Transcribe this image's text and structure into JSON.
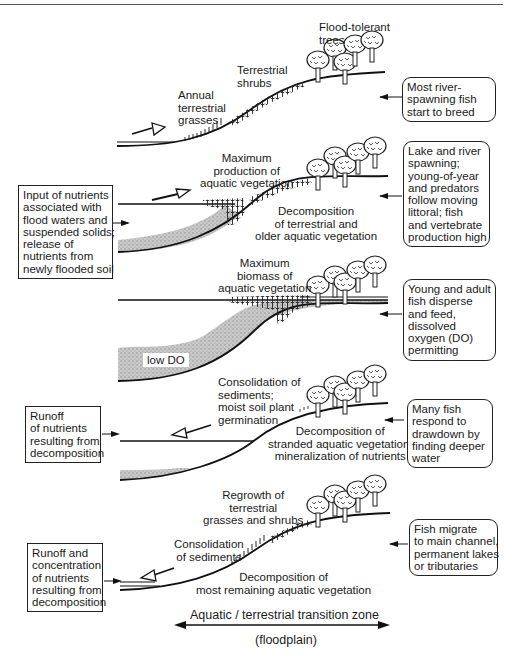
{
  "diagram": {
    "title_axis": {
      "label": "Aquatic / terrestrial transition zone",
      "sublabel": "(floodplain)"
    },
    "panels": [
      {
        "stage": 1,
        "vegetation_labels": [
          "Flood-tolerant\ntrees",
          "Terrestrial\nshrubs",
          "Annual\nterrestrial\ngrasses"
        ],
        "process_labels": [],
        "left_box": null,
        "right_box": "Most river-\nspawning fish\nstart to breed",
        "water_arrow": "rising"
      },
      {
        "stage": 2,
        "vegetation_labels": [
          "Maximum\nproduction of\naquatic vegetation"
        ],
        "process_labels": [
          "Decomposition\nof terrestrial and\nolder aquatic vegetation"
        ],
        "left_box": "Input of nutrients\nassociated with\nflood waters and\nsuspended solids;\nrelease of\nnutrients from\nnewly flooded soil",
        "right_box": "Lake and river\nspawning;\nyoung-of-year\nand predators\nfollow moving\nlittoral; fish\nand vertebrate\nproduction high",
        "water_arrow": "rising"
      },
      {
        "stage": 3,
        "vegetation_labels": [
          "Maximum\nbiomass of\naquatic vegetation"
        ],
        "process_labels": [],
        "zone_label": "low DO",
        "left_box": null,
        "right_box": "Young and adult\nfish disperse\nand feed,\ndissolved\noxygen (DO)\npermitting",
        "water_arrow": "none"
      },
      {
        "stage": 4,
        "vegetation_labels": [
          "Consolidation of\nsediments;\nmoist soil plant\ngermination"
        ],
        "process_labels": [
          "Decomposition of\nstranded aquatic vegetation,\nmineralization of nutrients"
        ],
        "left_box": "Runoff\nof nutrients\nresulting from\ndecomposition",
        "right_box": "Many fish\nrespond to\ndrawdown by\nfinding deeper\nwater",
        "water_arrow": "falling"
      },
      {
        "stage": 5,
        "vegetation_labels": [
          "Regrowth of\nterrestrial\ngrasses and shrubs",
          "Consolidation\nof sediments"
        ],
        "process_labels": [
          "Decomposition of\nmost remaining aquatic vegetation"
        ],
        "left_box": "Runoff and\nconcentration\nof nutrients\nresulting from\ndecomposition",
        "right_box": "Fish migrate\nto main channel,\npermanent lakes\nor tributaries",
        "water_arrow": "falling"
      }
    ]
  }
}
